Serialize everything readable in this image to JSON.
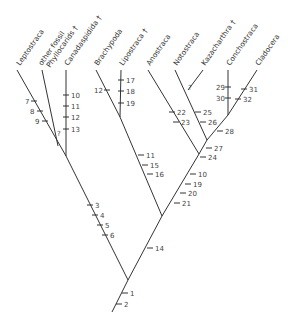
{
  "diagram": {
    "type": "cladogram",
    "taxa": [
      {
        "name": "Leptostraca",
        "label": "Leptostraca",
        "tip": [
          17,
          70
        ],
        "text_at": [
          20,
          66
        ]
      },
      {
        "name": "other-fossil-phyllocarids",
        "label": "other fossil",
        "label2": "Phyllocarids †",
        "tip": [
          42,
          70
        ],
        "text_at": [
          42,
          66
        ]
      },
      {
        "name": "Canadaspidida",
        "label": "Canadaspidida †",
        "tip": [
          66,
          70
        ],
        "text_at": [
          68,
          66
        ]
      },
      {
        "name": "Brachypoda",
        "label": "Brachypoda",
        "tip": [
          96,
          70
        ],
        "text_at": [
          98,
          66
        ]
      },
      {
        "name": "Lipostraca",
        "label": "Lipostraca †",
        "tip": [
          121,
          70
        ],
        "text_at": [
          123,
          66
        ]
      },
      {
        "name": "Anostraca",
        "label": "Anostraca",
        "tip": [
          148,
          70
        ],
        "text_at": [
          150,
          66
        ]
      },
      {
        "name": "Notostraca",
        "label": "Notostraca",
        "tip": [
          175,
          70
        ],
        "text_at": [
          177,
          66
        ]
      },
      {
        "name": "Kazacharthra",
        "label": "Kazacharthra †",
        "tip": [
          203,
          70
        ],
        "text_at": [
          205,
          66
        ]
      },
      {
        "name": "Conchostraca",
        "label": "Conchostraca",
        "tip": [
          228,
          70
        ],
        "text_at": [
          230,
          66
        ]
      },
      {
        "name": "Cladocera",
        "label": "Cladocera",
        "tip": [
          257,
          70
        ],
        "text_at": [
          259,
          66
        ]
      }
    ],
    "branches": [
      {
        "from": [
          128,
          280
        ],
        "to": [
          112,
          312
        ]
      },
      {
        "from": [
          128,
          280
        ],
        "to": [
          66,
          156
        ]
      },
      {
        "from": [
          66,
          156
        ],
        "to": [
          17,
          70
        ]
      },
      {
        "from": [
          66,
          156
        ],
        "to": [
          66,
          70
        ]
      },
      {
        "from": [
          58,
          146
        ],
        "to": [
          42,
          70
        ]
      },
      {
        "from": [
          128,
          280
        ],
        "to": [
          162,
          216
        ]
      },
      {
        "from": [
          162,
          216
        ],
        "to": [
          120,
          117
        ]
      },
      {
        "from": [
          120,
          117
        ],
        "to": [
          121,
          70
        ]
      },
      {
        "from": [
          120,
          117
        ],
        "to": [
          96,
          70
        ]
      },
      {
        "from": [
          162,
          216
        ],
        "to": [
          199,
          154
        ]
      },
      {
        "from": [
          199,
          154
        ],
        "to": [
          148,
          70
        ]
      },
      {
        "from": [
          199,
          154
        ],
        "to": [
          207,
          140
        ]
      },
      {
        "from": [
          207,
          140
        ],
        "to": [
          175,
          70
        ]
      },
      {
        "from": [
          203,
          70
        ],
        "to": [
          188,
          90
        ]
      },
      {
        "from": [
          207,
          140
        ],
        "to": [
          228,
          115
        ]
      },
      {
        "from": [
          228,
          115
        ],
        "to": [
          228,
          70
        ]
      },
      {
        "from": [
          228,
          115
        ],
        "to": [
          257,
          70
        ]
      }
    ],
    "characters": [
      {
        "n": "1",
        "at": [
          125,
          293
        ],
        "lx": 130,
        "ly": 296
      },
      {
        "n": "2",
        "at": [
          119,
          304
        ],
        "lx": 124,
        "ly": 307
      },
      {
        "n": "3",
        "at": [
          90,
          205
        ],
        "lx": 95,
        "ly": 208
      },
      {
        "n": "4",
        "at": [
          95,
          215
        ],
        "lx": 100,
        "ly": 218
      },
      {
        "n": "5",
        "at": [
          100,
          225
        ],
        "lx": 105,
        "ly": 228
      },
      {
        "n": "6",
        "at": [
          105,
          235
        ],
        "lx": 110,
        "ly": 238
      },
      {
        "n": "7",
        "at": [
          34,
          101
        ],
        "lx": 25,
        "ly": 104
      },
      {
        "n": "8",
        "at": [
          40,
          111
        ],
        "lx": 30,
        "ly": 114
      },
      {
        "n": "9",
        "at": [
          45,
          121
        ],
        "lx": 35,
        "ly": 124
      },
      {
        "n": "10",
        "at": [
          66,
          95
        ],
        "lx": 71,
        "ly": 98
      },
      {
        "n": "11",
        "at": [
          66,
          106
        ],
        "lx": 71,
        "ly": 109
      },
      {
        "n": "12",
        "at": [
          66,
          117
        ],
        "lx": 71,
        "ly": 120
      },
      {
        "n": "13",
        "at": [
          66,
          129
        ],
        "lx": 71,
        "ly": 132
      },
      {
        "n": "12",
        "at": [
          107,
          90
        ],
        "lx": 94,
        "ly": 93
      },
      {
        "n": "17",
        "at": [
          121,
          80
        ],
        "lx": 126,
        "ly": 83
      },
      {
        "n": "18",
        "at": [
          121,
          91
        ],
        "lx": 126,
        "ly": 94
      },
      {
        "n": "19",
        "at": [
          121,
          103
        ],
        "lx": 126,
        "ly": 106
      },
      {
        "n": "11",
        "at": [
          141,
          155
        ],
        "lx": 146,
        "ly": 158
      },
      {
        "n": "15",
        "at": [
          145,
          165
        ],
        "lx": 150,
        "ly": 168
      },
      {
        "n": "16",
        "at": [
          150,
          174
        ],
        "lx": 155,
        "ly": 177
      },
      {
        "n": "22",
        "at": [
          172,
          112
        ],
        "lx": 177,
        "ly": 115
      },
      {
        "n": "23",
        "at": [
          176,
          122
        ],
        "lx": 181,
        "ly": 125
      },
      {
        "n": "25",
        "at": [
          198,
          112
        ],
        "lx": 203,
        "ly": 115
      },
      {
        "n": "26",
        "at": [
          203,
          122
        ],
        "lx": 208,
        "ly": 125
      },
      {
        "n": "27",
        "at": [
          209,
          148
        ],
        "lx": 214,
        "ly": 151
      },
      {
        "n": "24",
        "at": [
          203,
          157
        ],
        "lx": 208,
        "ly": 160
      },
      {
        "n": "28",
        "at": [
          220,
          131
        ],
        "lx": 225,
        "ly": 134
      },
      {
        "n": "29",
        "at": [
          228,
          87
        ],
        "lx": 216,
        "ly": 90
      },
      {
        "n": "30",
        "at": [
          228,
          98
        ],
        "lx": 216,
        "ly": 101
      },
      {
        "n": "31",
        "at": [
          244,
          89
        ],
        "lx": 249,
        "ly": 92
      },
      {
        "n": "32",
        "at": [
          238,
          99
        ],
        "lx": 243,
        "ly": 102
      },
      {
        "n": "10",
        "at": [
          193,
          174
        ],
        "lx": 198,
        "ly": 177
      },
      {
        "n": "19",
        "at": [
          188,
          184
        ],
        "lx": 193,
        "ly": 187
      },
      {
        "n": "20",
        "at": [
          183,
          193
        ],
        "lx": 188,
        "ly": 196
      },
      {
        "n": "21",
        "at": [
          177,
          203
        ],
        "lx": 182,
        "ly": 206
      },
      {
        "n": "14",
        "at": [
          150,
          248
        ],
        "lx": 155,
        "ly": 251
      },
      {
        "n": "?",
        "at": [
          58,
          146
        ],
        "lx": 57,
        "ly": 136
      },
      {
        "n": "?",
        "at": [
          188,
          90
        ],
        "lx": 188,
        "ly": 90
      }
    ]
  }
}
